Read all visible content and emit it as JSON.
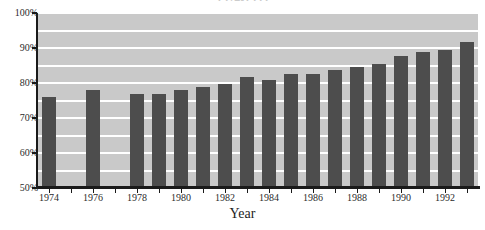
{
  "chart_data": {
    "type": "bar",
    "title": "1974-1993",
    "title_truncated": true,
    "xlabel": "Year",
    "ylabel": "",
    "ylim": [
      50,
      100
    ],
    "ytick_labels": [
      "50%",
      "60%",
      "70%",
      "80%",
      "90%",
      "100%"
    ],
    "ytick_values": [
      50,
      60,
      70,
      80,
      90,
      100
    ],
    "grid": true,
    "gridline_interval": 5,
    "legend": "none",
    "xtick_labels": [
      "1974",
      "1976",
      "1978",
      "1980",
      "1982",
      "1984",
      "1986",
      "1988",
      "1990",
      "1992"
    ],
    "xtick_values": [
      1974,
      1976,
      1978,
      1980,
      1982,
      1984,
      1986,
      1988,
      1990,
      1992
    ],
    "x_range": [
      1974,
      1993
    ],
    "categories": [
      1974,
      1975,
      1976,
      1977,
      1978,
      1979,
      1980,
      1981,
      1982,
      1983,
      1984,
      1985,
      1986,
      1987,
      1988,
      1989,
      1990,
      1991,
      1992,
      1993
    ],
    "values": [
      76.0,
      null,
      78.0,
      null,
      77.0,
      77.0,
      78.0,
      79.0,
      79.7,
      81.8,
      80.8,
      82.6,
      82.6,
      83.6,
      84.5,
      85.5,
      87.7,
      88.8,
      89.5,
      91.7
    ],
    "missing_categories": [
      1975,
      1977
    ],
    "colors": {
      "bar": "#4d4d4d",
      "plot_background": "#c9c9c9",
      "gridline": "#ffffff",
      "axis": "#1a1a1a",
      "tick_text": "#2b2b2b",
      "page_background": "#ffffff"
    }
  }
}
